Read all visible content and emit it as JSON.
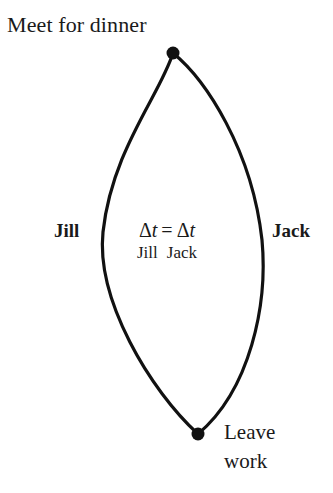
{
  "figure": {
    "background_color": "#ffffff",
    "ink_color": "#1a1a1a",
    "stroke_color": "#111111",
    "stroke_width": 3.2,
    "vertex_radius": 6.5
  },
  "labels": {
    "top_event": "Meet for dinner",
    "left_path": "Jill",
    "right_path": "Jack",
    "bottom_event_line1": "Leave",
    "bottom_event_line2": "work"
  },
  "equation": {
    "delta": "Δ",
    "variable": "t",
    "relation": "=",
    "subscript_left": "Jill",
    "subscript_right": "Jack",
    "plain_text": "Δt_Jill = Δt_Jack"
  },
  "geometry": {
    "top_vertex": {
      "x": 173,
      "y": 53
    },
    "bottom_vertex": {
      "x": 198,
      "y": 434
    },
    "left_arc_path": "M 173 53 C 160 95 112 150 103 232 C 96 300 150 390 198 434",
    "right_arc_path": "M 173 53 C 206 80 252 150 262 240 C 268 305 250 390 198 434"
  }
}
